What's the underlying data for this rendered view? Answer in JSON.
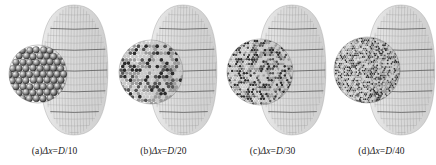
{
  "figure": {
    "background_color": "#ffffff",
    "ink_color": "#1a1a1a",
    "mesh_color": "#9a9a9a",
    "particle_dark": "#2b2b2b",
    "particle_light": "#d8d8d8",
    "panel_count": 4
  },
  "panels": [
    {
      "id": "a",
      "label": "(a)",
      "caption_prefix": "(a)",
      "caption_var": "Δx",
      "caption_eq": "=",
      "caption_num": "D",
      "caption_den": "/10",
      "caption_full": "(a)Δx=D/10",
      "resolution": "D/10",
      "divisor": 10,
      "particle_radius_px": 3.4,
      "particle_count": 190,
      "cluster_cx": 38,
      "cluster_cy": 72,
      "cluster_r": 29,
      "mesh_cx": 74,
      "mesh_rx": 26,
      "mesh_ry": 65,
      "mesh_rings": 9,
      "mesh_spokes": 22
    },
    {
      "id": "b",
      "label": "(b)",
      "caption_prefix": "(b)",
      "caption_var": "Δx",
      "caption_eq": "=",
      "caption_num": "D",
      "caption_den": "/20",
      "caption_full": "(b)Δx=D/20",
      "resolution": "D/20",
      "divisor": 20,
      "particle_radius_px": 1.9,
      "particle_count": 560,
      "cluster_cx": 42,
      "cluster_cy": 70,
      "cluster_r": 32,
      "mesh_cx": 74,
      "mesh_rx": 26,
      "mesh_ry": 65,
      "mesh_rings": 9,
      "mesh_spokes": 22
    },
    {
      "id": "c",
      "label": "(c)",
      "caption_prefix": "(c)",
      "caption_var": "Δx",
      "caption_eq": "=",
      "caption_num": "D",
      "caption_den": "/30",
      "caption_full": "(c)Δx=D/30",
      "resolution": "D/30",
      "divisor": 30,
      "particle_radius_px": 1.3,
      "particle_count": 1150,
      "cluster_cx": 42,
      "cluster_cy": 70,
      "cluster_r": 33,
      "mesh_cx": 74,
      "mesh_rx": 26,
      "mesh_ry": 65,
      "mesh_rings": 9,
      "mesh_spokes": 22
    },
    {
      "id": "d",
      "label": "(d)",
      "caption_prefix": "(d)",
      "caption_var": "Δx",
      "caption_eq": "=",
      "caption_num": "D",
      "caption_den": "/40",
      "caption_full": "(d)Δx=D/40",
      "resolution": "D/40",
      "divisor": 40,
      "particle_radius_px": 0.95,
      "particle_count": 1900,
      "cluster_cx": 40,
      "cluster_cy": 68,
      "cluster_r": 33,
      "mesh_cx": 74,
      "mesh_rx": 26,
      "mesh_ry": 65,
      "mesh_rings": 9,
      "mesh_spokes": 22
    }
  ]
}
